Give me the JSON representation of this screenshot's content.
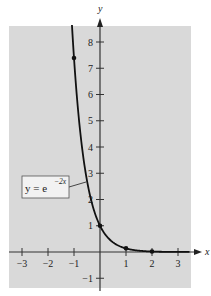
{
  "chart_data": {
    "type": "line",
    "title": "",
    "function": "y = e^(-2x)",
    "xlabel": "x",
    "ylabel": "y",
    "xlim": [
      -3.5,
      3.5
    ],
    "ylim": [
      -1.4,
      8.6
    ],
    "x_ticks": [
      -3,
      -2,
      -1,
      1,
      2,
      3
    ],
    "y_ticks": [
      -1,
      1,
      2,
      3,
      4,
      5,
      6,
      7,
      8
    ],
    "x_tick_labels": [
      "−3",
      "−2",
      "−1",
      "1",
      "2",
      "3"
    ],
    "y_tick_labels": [
      "−1",
      "1",
      "2",
      "3",
      "4",
      "5",
      "6",
      "7",
      "8"
    ],
    "grid": false,
    "background": "#d9d9d9",
    "series": [
      {
        "name": "y = e^{-2x}",
        "color": "#111111",
        "x": [
          -1.08,
          -1,
          -0.75,
          -0.5,
          -0.25,
          0,
          0.25,
          0.5,
          0.75,
          1,
          1.5,
          2,
          2.5,
          3,
          3.5
        ],
        "values": [
          8.67,
          7.39,
          4.48,
          2.72,
          1.65,
          1.0,
          0.61,
          0.37,
          0.22,
          0.14,
          0.05,
          0.02,
          0.007,
          0.002,
          0.001
        ]
      }
    ],
    "marked_points": [
      {
        "x": -1,
        "y": 7.39
      },
      {
        "x": 0,
        "y": 1
      },
      {
        "x": 1,
        "y": 0.14
      },
      {
        "x": 2,
        "y": 0.02
      }
    ],
    "annotation": {
      "text_base": "y = e",
      "text_exponent": "−2x",
      "points_to": {
        "x": -0.55,
        "y": 2.7
      }
    }
  }
}
